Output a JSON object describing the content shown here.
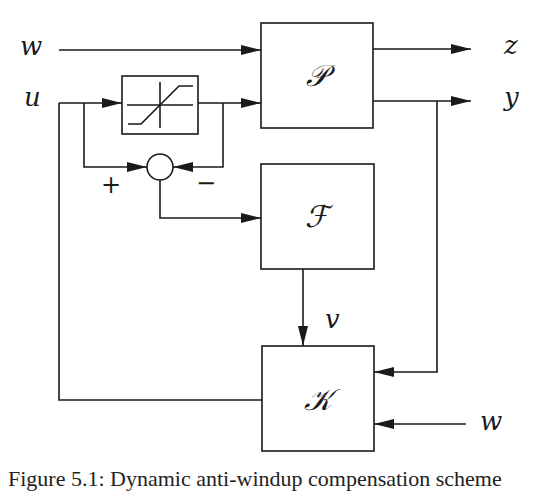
{
  "figure": {
    "caption": "Figure 5.1: Dynamic anti-windup compensation scheme",
    "blocks": {
      "plant": {
        "label": "𝒫",
        "name": "P"
      },
      "filter": {
        "label": "ℱ",
        "name": "F"
      },
      "controller": {
        "label": "𝒦",
        "name": "K"
      },
      "saturation": {
        "name": "saturation"
      },
      "sum": {
        "name": "summing-junction",
        "plus": "+",
        "minus": "−"
      }
    },
    "signals": {
      "w_in": "w",
      "u_in": "u",
      "z_out": "z",
      "y_out": "y",
      "v": "v",
      "w_k": "w"
    },
    "colors": {
      "stroke": "#1a1a1a",
      "background": "#ffffff"
    }
  }
}
